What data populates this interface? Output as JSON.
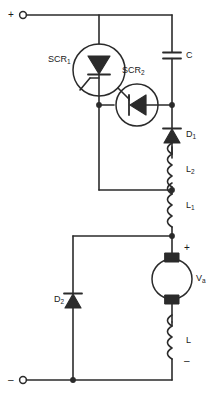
{
  "diagram": {
    "stroke_color": "#2b2b2b",
    "background": "#ffffff",
    "terminals": {
      "positive": "+",
      "negative": "–"
    },
    "labels": {
      "scr1": "SCR",
      "scr1_sub": "1",
      "scr2": "SCR",
      "scr2_sub": "2",
      "capacitor_c": "C",
      "diode_d1": "D",
      "diode_d1_sub": "1",
      "diode_d2": "D",
      "diode_d2_sub": "2",
      "inductor_l2": "L",
      "inductor_l2_sub": "2",
      "inductor_l1": "L",
      "inductor_l1_sub": "1",
      "inductor_l": "L",
      "motor_voltage": "V",
      "motor_voltage_sub": "a",
      "motor_plus": "+",
      "motor_minus": "–"
    }
  }
}
